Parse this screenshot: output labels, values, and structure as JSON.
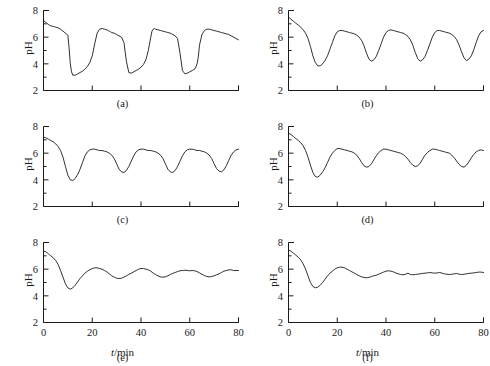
{
  "figure": {
    "background_color": "#ffffff",
    "line_color": "#1a1a1a",
    "axis_label_y": "pH",
    "axis_label_x_var": "t",
    "axis_label_x_unit": "/min",
    "axis_label_x": "t/min"
  },
  "axes": {
    "y_ticks_major": [
      "2",
      "4",
      "6",
      "8"
    ],
    "y_tick_values": [
      2,
      4,
      6,
      8
    ],
    "y_minor_values": [
      3,
      5,
      7
    ],
    "ylim": [
      2,
      8
    ],
    "x_ticks_major": [
      "0",
      "20",
      "40",
      "60",
      "80"
    ],
    "x_tick_values": [
      0,
      20,
      40,
      60,
      80
    ],
    "xlim": [
      0,
      80
    ],
    "grid": "off"
  },
  "panels": [
    {
      "id": "a",
      "label": "(a)",
      "show_x_labels": false
    },
    {
      "id": "b",
      "label": "(b)",
      "show_x_labels": false
    },
    {
      "id": "c",
      "label": "(c)",
      "show_x_labels": false
    },
    {
      "id": "d",
      "label": "(d)",
      "show_x_labels": false
    },
    {
      "id": "e",
      "label": "(e)",
      "show_x_labels": true
    },
    {
      "id": "f",
      "label": "(f)",
      "show_x_labels": true
    }
  ],
  "chart_data": [
    {
      "type": "line",
      "panel": "a",
      "title": "(a)",
      "xlabel": "t/min",
      "ylabel": "pH",
      "xlim": [
        0,
        80
      ],
      "ylim": [
        2,
        8
      ],
      "description": "Large-amplitude relaxation pH oscillations: slow rise to ~6.6 then sharp drop to ~3.1, period ~17 min",
      "x": [
        0,
        1,
        2,
        3,
        4,
        5,
        6,
        7,
        8,
        9,
        10,
        10.5,
        11,
        11.5,
        12,
        13,
        14,
        15,
        16,
        17,
        18,
        19,
        20,
        21,
        22,
        23,
        24,
        25,
        26,
        26.5,
        27,
        27.5,
        28,
        29,
        30,
        31,
        32,
        33,
        34,
        35,
        36,
        37,
        38,
        39,
        40,
        41,
        42,
        43,
        44,
        44.5,
        45,
        45.5,
        46,
        47,
        48,
        49,
        50,
        51,
        52,
        53,
        54,
        55,
        56,
        57,
        58,
        59,
        60,
        61,
        62,
        62.5,
        63,
        63.5,
        64,
        65,
        66,
        67,
        68,
        69,
        70,
        71,
        72,
        73,
        74,
        75,
        76,
        77,
        78,
        79,
        80
      ],
      "y": [
        7.25,
        7.1,
        6.95,
        6.85,
        6.8,
        6.75,
        6.7,
        6.6,
        6.45,
        6.3,
        6.15,
        5.2,
        4.0,
        3.4,
        3.15,
        3.15,
        3.25,
        3.35,
        3.45,
        3.6,
        3.8,
        4.1,
        4.6,
        5.5,
        6.3,
        6.6,
        6.65,
        6.6,
        6.55,
        6.5,
        6.45,
        6.4,
        6.35,
        6.3,
        6.2,
        6.1,
        6.0,
        5.6,
        4.2,
        3.35,
        3.3,
        3.4,
        3.5,
        3.6,
        3.75,
        3.95,
        4.3,
        5.0,
        6.0,
        6.45,
        6.6,
        6.65,
        6.6,
        6.55,
        6.5,
        6.45,
        6.4,
        6.35,
        6.3,
        6.2,
        6.1,
        5.9,
        4.8,
        3.5,
        3.25,
        3.3,
        3.4,
        3.5,
        3.6,
        3.75,
        4.0,
        4.5,
        5.4,
        6.2,
        6.5,
        6.6,
        6.6,
        6.55,
        6.5,
        6.45,
        6.4,
        6.35,
        6.3,
        6.25,
        6.2,
        6.1,
        6.0,
        5.9,
        5.8,
        5.7,
        5.6
      ]
    },
    {
      "type": "line",
      "panel": "b",
      "title": "(b)",
      "xlabel": "t/min",
      "ylabel": "pH",
      "xlim": [
        0,
        80
      ],
      "ylim": [
        2,
        8
      ],
      "description": "Smoother large oscillations, maxima ~6.5, minima ~3.9-4.3, period ~18 min",
      "x": [
        0,
        1,
        2,
        3,
        4,
        5,
        6,
        7,
        8,
        9,
        10,
        11,
        12,
        13,
        14,
        15,
        16,
        17,
        18,
        19,
        20,
        21,
        22,
        23,
        24,
        25,
        26,
        27,
        28,
        29,
        30,
        31,
        32,
        33,
        34,
        35,
        36,
        37,
        38,
        39,
        40,
        41,
        42,
        43,
        44,
        45,
        46,
        47,
        48,
        49,
        50,
        51,
        52,
        53,
        54,
        55,
        56,
        57,
        58,
        59,
        60,
        61,
        62,
        63,
        64,
        65,
        66,
        67,
        68,
        69,
        70,
        71,
        72,
        73,
        74,
        75,
        76,
        77,
        78,
        79,
        80
      ],
      "y": [
        7.5,
        7.35,
        7.2,
        7.05,
        6.9,
        6.75,
        6.55,
        6.3,
        5.9,
        5.3,
        4.6,
        4.1,
        3.85,
        3.85,
        4.0,
        4.25,
        4.6,
        5.1,
        5.6,
        6.1,
        6.4,
        6.5,
        6.5,
        6.45,
        6.4,
        6.35,
        6.3,
        6.25,
        6.15,
        6.0,
        5.75,
        5.35,
        4.8,
        4.35,
        4.2,
        4.3,
        4.55,
        5.0,
        5.5,
        6.0,
        6.35,
        6.5,
        6.55,
        6.5,
        6.45,
        6.4,
        6.35,
        6.3,
        6.2,
        6.05,
        5.8,
        5.4,
        4.85,
        4.4,
        4.2,
        4.3,
        4.55,
        5.0,
        5.5,
        6.0,
        6.35,
        6.5,
        6.5,
        6.45,
        6.4,
        6.35,
        6.3,
        6.2,
        6.05,
        5.8,
        5.4,
        4.9,
        4.45,
        4.25,
        4.35,
        4.6,
        5.05,
        5.6,
        6.1,
        6.4,
        6.5
      ]
    },
    {
      "type": "line",
      "panel": "c",
      "title": "(c)",
      "xlabel": "t/min",
      "ylabel": "pH",
      "xlim": [
        0,
        80
      ],
      "ylim": [
        2,
        8
      ],
      "description": "Oscillations with maxima ~6.3 and minima ~4.0 (first) then ~4.5-4.6, period ~17 min",
      "x": [
        0,
        1,
        2,
        3,
        4,
        5,
        6,
        7,
        8,
        9,
        10,
        11,
        12,
        13,
        14,
        15,
        16,
        17,
        18,
        19,
        20,
        21,
        22,
        23,
        24,
        25,
        26,
        27,
        28,
        29,
        30,
        31,
        32,
        33,
        34,
        35,
        36,
        37,
        38,
        39,
        40,
        41,
        42,
        43,
        44,
        45,
        46,
        47,
        48,
        49,
        50,
        51,
        52,
        53,
        54,
        55,
        56,
        57,
        58,
        59,
        60,
        61,
        62,
        63,
        64,
        65,
        66,
        67,
        68,
        69,
        70,
        71,
        72,
        73,
        74,
        75,
        76,
        77,
        78,
        79,
        80
      ],
      "y": [
        7.2,
        7.15,
        7.05,
        6.95,
        6.85,
        6.7,
        6.5,
        6.2,
        5.7,
        5.0,
        4.35,
        4.0,
        3.95,
        4.1,
        4.4,
        4.8,
        5.3,
        5.8,
        6.1,
        6.25,
        6.3,
        6.3,
        6.25,
        6.2,
        6.2,
        6.15,
        6.1,
        6.0,
        5.85,
        5.6,
        5.2,
        4.8,
        4.6,
        4.55,
        4.7,
        5.0,
        5.4,
        5.8,
        6.1,
        6.25,
        6.3,
        6.3,
        6.25,
        6.2,
        6.2,
        6.15,
        6.1,
        6.0,
        5.85,
        5.6,
        5.2,
        4.8,
        4.6,
        4.55,
        4.7,
        5.0,
        5.4,
        5.8,
        6.1,
        6.25,
        6.3,
        6.3,
        6.25,
        6.2,
        6.2,
        6.15,
        6.1,
        6.0,
        5.85,
        5.6,
        5.2,
        4.85,
        4.65,
        4.6,
        4.75,
        5.05,
        5.45,
        5.85,
        6.1,
        6.25,
        6.3
      ]
    },
    {
      "type": "line",
      "panel": "d",
      "title": "(d)",
      "xlabel": "t/min",
      "ylabel": "pH",
      "xlim": [
        0,
        80
      ],
      "ylim": [
        2,
        8
      ],
      "description": "Reduced amplitude oscillations, maxima ~6.3, minima ~4.2 (first) then ~4.9-5.0",
      "x": [
        0,
        1,
        2,
        3,
        4,
        5,
        6,
        7,
        8,
        9,
        10,
        11,
        12,
        13,
        14,
        15,
        16,
        17,
        18,
        19,
        20,
        21,
        22,
        23,
        24,
        25,
        26,
        27,
        28,
        29,
        30,
        31,
        32,
        33,
        34,
        35,
        36,
        37,
        38,
        39,
        40,
        41,
        42,
        43,
        44,
        45,
        46,
        47,
        48,
        49,
        50,
        51,
        52,
        53,
        54,
        55,
        56,
        57,
        58,
        59,
        60,
        61,
        62,
        63,
        64,
        65,
        66,
        67,
        68,
        69,
        70,
        71,
        72,
        73,
        74,
        75,
        76,
        77,
        78,
        79,
        80
      ],
      "y": [
        7.5,
        7.4,
        7.25,
        7.1,
        6.95,
        6.8,
        6.55,
        6.2,
        5.7,
        5.1,
        4.55,
        4.25,
        4.2,
        4.35,
        4.6,
        4.9,
        5.3,
        5.7,
        6.0,
        6.2,
        6.35,
        6.35,
        6.3,
        6.25,
        6.2,
        6.15,
        6.1,
        6.0,
        5.85,
        5.6,
        5.3,
        5.05,
        4.95,
        5.0,
        5.2,
        5.5,
        5.8,
        6.05,
        6.2,
        6.3,
        6.3,
        6.25,
        6.2,
        6.15,
        6.1,
        6.05,
        6.0,
        5.9,
        5.75,
        5.55,
        5.3,
        5.1,
        5.0,
        5.05,
        5.25,
        5.55,
        5.85,
        6.05,
        6.2,
        6.3,
        6.3,
        6.25,
        6.2,
        6.15,
        6.1,
        6.05,
        6.0,
        5.85,
        5.65,
        5.4,
        5.15,
        5.0,
        4.95,
        5.1,
        5.35,
        5.65,
        5.9,
        6.1,
        6.2,
        6.25,
        6.2
      ]
    },
    {
      "type": "line",
      "panel": "e",
      "title": "(e)",
      "xlabel": "t/min",
      "ylabel": "pH",
      "xlim": [
        0,
        80
      ],
      "ylim": [
        2,
        8
      ],
      "description": "Damped oscillations: deep first minimum ~4.5 at t=11, then small sustained oscillation between ~5.3 and ~6.1",
      "x": [
        0,
        1,
        2,
        3,
        4,
        5,
        6,
        7,
        8,
        9,
        10,
        11,
        12,
        13,
        14,
        15,
        16,
        17,
        18,
        19,
        20,
        21,
        22,
        23,
        24,
        25,
        26,
        27,
        28,
        29,
        30,
        31,
        32,
        33,
        34,
        35,
        36,
        37,
        38,
        39,
        40,
        41,
        42,
        43,
        44,
        45,
        46,
        47,
        48,
        49,
        50,
        51,
        52,
        53,
        54,
        55,
        56,
        57,
        58,
        59,
        60,
        61,
        62,
        63,
        64,
        65,
        66,
        67,
        68,
        69,
        70,
        71,
        72,
        73,
        74,
        75,
        76,
        77,
        78,
        79,
        80
      ],
      "y": [
        7.35,
        7.3,
        7.15,
        7.0,
        6.85,
        6.65,
        6.35,
        5.9,
        5.4,
        4.9,
        4.6,
        4.5,
        4.6,
        4.8,
        5.05,
        5.3,
        5.5,
        5.7,
        5.85,
        5.95,
        6.05,
        6.1,
        6.1,
        6.05,
        6.0,
        5.9,
        5.8,
        5.65,
        5.5,
        5.4,
        5.32,
        5.3,
        5.32,
        5.4,
        5.5,
        5.6,
        5.7,
        5.8,
        5.9,
        6.0,
        6.05,
        6.05,
        6.0,
        5.95,
        5.85,
        5.7,
        5.6,
        5.5,
        5.42,
        5.4,
        5.42,
        5.5,
        5.6,
        5.68,
        5.75,
        5.82,
        5.88,
        5.9,
        5.92,
        5.9,
        5.88,
        5.9,
        5.88,
        5.82,
        5.72,
        5.62,
        5.52,
        5.45,
        5.42,
        5.45,
        5.5,
        5.58,
        5.65,
        5.75,
        5.85,
        5.9,
        5.95,
        5.95,
        5.9,
        5.9,
        5.9
      ]
    },
    {
      "type": "line",
      "panel": "f",
      "title": "(f)",
      "xlabel": "t/min",
      "ylabel": "pH",
      "xlim": [
        0,
        80
      ],
      "ylim": [
        2,
        8
      ],
      "description": "Strongly damped oscillations: minimum ~4.6 at t=11, overshoot ~6.15 at t=22, settling toward steady state ~5.7",
      "x": [
        0,
        1,
        2,
        3,
        4,
        5,
        6,
        7,
        8,
        9,
        10,
        11,
        12,
        13,
        14,
        15,
        16,
        17,
        18,
        19,
        20,
        21,
        22,
        23,
        24,
        25,
        26,
        27,
        28,
        29,
        30,
        31,
        32,
        33,
        34,
        35,
        36,
        37,
        38,
        39,
        40,
        41,
        42,
        43,
        44,
        45,
        46,
        47,
        48,
        49,
        50,
        51,
        52,
        53,
        54,
        55,
        56,
        57,
        58,
        59,
        60,
        61,
        62,
        63,
        64,
        65,
        66,
        67,
        68,
        69,
        70,
        71,
        72,
        73,
        74,
        75,
        76,
        77,
        78,
        79,
        80
      ],
      "y": [
        7.45,
        7.35,
        7.2,
        7.05,
        6.9,
        6.7,
        6.4,
        6.0,
        5.5,
        5.0,
        4.7,
        4.6,
        4.65,
        4.8,
        5.0,
        5.25,
        5.5,
        5.7,
        5.85,
        6.0,
        6.1,
        6.15,
        6.15,
        6.1,
        6.0,
        5.9,
        5.8,
        5.7,
        5.6,
        5.5,
        5.42,
        5.38,
        5.35,
        5.38,
        5.45,
        5.5,
        5.55,
        5.62,
        5.7,
        5.78,
        5.85,
        5.88,
        5.85,
        5.8,
        5.72,
        5.65,
        5.6,
        5.58,
        5.62,
        5.7,
        5.6,
        5.58,
        5.6,
        5.62,
        5.65,
        5.68,
        5.7,
        5.72,
        5.75,
        5.72,
        5.7,
        5.72,
        5.75,
        5.7,
        5.65,
        5.62,
        5.6,
        5.62,
        5.65,
        5.68,
        5.62,
        5.6,
        5.62,
        5.65,
        5.68,
        5.7,
        5.72,
        5.75,
        5.78,
        5.78,
        5.75
      ]
    }
  ]
}
